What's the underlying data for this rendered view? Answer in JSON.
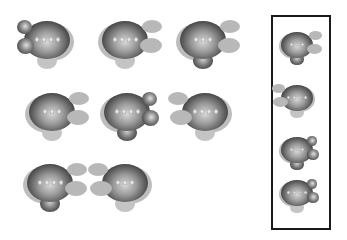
{
  "diagram": {
    "type": "visual-reasoning-puzzle",
    "colors": {
      "background": "#ffffff",
      "figure_dark": "#3a3a3a",
      "figure_light": "#bdbdbd",
      "frame": "#1a1a1a"
    },
    "left_figures": [
      {
        "id": "A",
        "ears": "dark",
        "ear_side": "left",
        "stem": "light",
        "dots": 4
      },
      {
        "id": "B",
        "ears": "gray",
        "ear_side": "right",
        "stem": "light",
        "dots": 4
      },
      {
        "id": "C",
        "ears": "gray",
        "ear_side": "right",
        "stem": "dark",
        "dots": 3
      },
      {
        "id": "D",
        "ears": "gray",
        "ear_side": "right",
        "stem": "light",
        "dots": 3
      },
      {
        "id": "E",
        "ears": "dark",
        "ear_side": "right",
        "stem": "dark",
        "dots": 4
      },
      {
        "id": "F",
        "ears": "gray",
        "ear_side": "left",
        "stem": "light",
        "dots": 4
      },
      {
        "id": "G",
        "ears": "gray",
        "ear_side": "right",
        "stem": "dark",
        "dots": 4
      },
      {
        "id": "H",
        "ears": "gray",
        "ear_side": "left",
        "stem": "light",
        "dots": 3
      }
    ],
    "options": [
      {
        "id": "1",
        "ears": "gray",
        "ear_side": "right",
        "stem": "dark",
        "dots": 3
      },
      {
        "id": "2",
        "ears": "gray",
        "ear_side": "left",
        "stem": "light",
        "dots": 4
      },
      {
        "id": "3",
        "ears": "dark",
        "ear_side": "right",
        "stem": "dark",
        "dots": 3
      },
      {
        "id": "4",
        "ears": "dark",
        "ear_side": "right",
        "stem": "light",
        "dots": 4
      }
    ]
  }
}
